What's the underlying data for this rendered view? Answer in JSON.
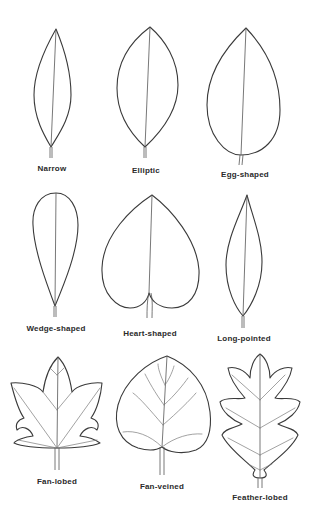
{
  "diagram": {
    "leaves": [
      {
        "id": "narrow",
        "label": "Narrow"
      },
      {
        "id": "elliptic",
        "label": "Elliptic"
      },
      {
        "id": "egg-shaped",
        "label": "Egg-shaped"
      },
      {
        "id": "wedge-shaped",
        "label": "Wedge-shaped"
      },
      {
        "id": "heart-shaped",
        "label": "Heart-shaped"
      },
      {
        "id": "long-pointed",
        "label": "Long-pointed"
      },
      {
        "id": "fan-lobed",
        "label": "Fan-lobed"
      },
      {
        "id": "fan-veined",
        "label": "Fan-veined"
      },
      {
        "id": "feather-lobed",
        "label": "Feather-lobed"
      }
    ],
    "colors": {
      "background": "#ffffff",
      "line": "#3a3a3a",
      "text": "#2a2a2a"
    }
  }
}
